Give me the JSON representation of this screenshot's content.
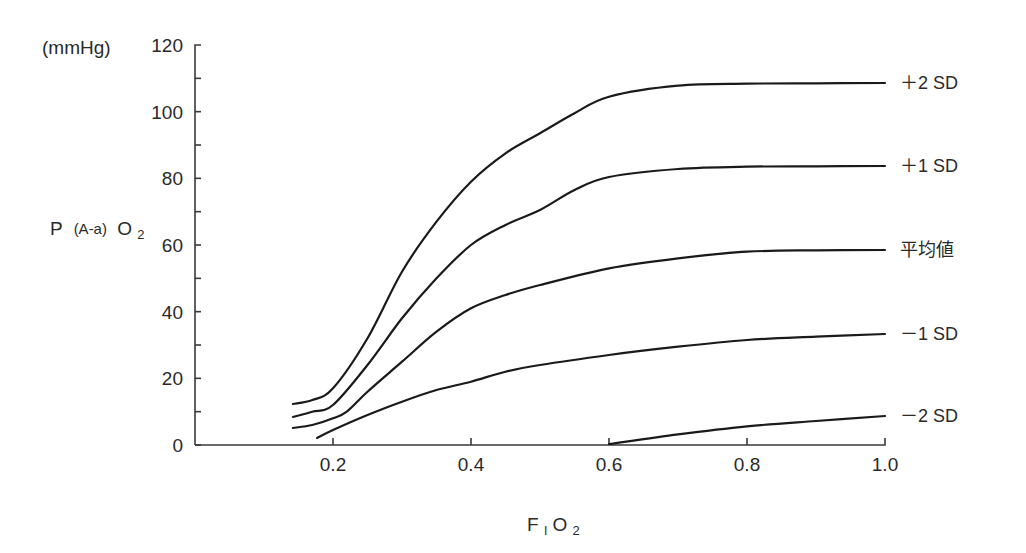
{
  "chart_data": {
    "type": "line",
    "title": "",
    "xlabel": "FIO2",
    "xlabel_main": "F",
    "xlabel_sub": "I",
    "xlabel_tail": "O",
    "xlabel_tail_sub": "2",
    "ylabel": "P(A-a)O2",
    "ylabel_parts": {
      "p": "P",
      "paren": "(A-a)",
      "o": "O",
      "sub": "2"
    },
    "yunit": "(mmHg)",
    "xlim": [
      0.0,
      1.0
    ],
    "ylim": [
      0,
      120
    ],
    "x_ticks": [
      0.2,
      0.4,
      0.6,
      0.8,
      1.0
    ],
    "x_tick_labels": [
      "0.2",
      "0.4",
      "0.6",
      "0.8",
      "1.0"
    ],
    "y_ticks": [
      0,
      20,
      40,
      60,
      80,
      100,
      120
    ],
    "y_tick_labels": [
      "0",
      "20",
      "40",
      "60",
      "80",
      "100",
      "120"
    ],
    "y_minor_ticks": [
      10,
      30,
      50,
      70,
      90,
      110
    ],
    "grid": false,
    "legend_position": "right (inline labels at curve ends)",
    "series": [
      {
        "name": "+2 SD",
        "label": "＋2 SD",
        "x": [
          0.142,
          0.17,
          0.2,
          0.25,
          0.3,
          0.35,
          0.4,
          0.45,
          0.5,
          0.55,
          0.6,
          0.7,
          0.8,
          0.9,
          1.0
        ],
        "values": [
          12.3,
          13.5,
          17,
          32,
          52,
          67,
          79,
          87.5,
          93.5,
          99.5,
          104.5,
          107.8,
          108.4,
          108.5,
          108.6
        ]
      },
      {
        "name": "+1 SD",
        "label": "＋1 SD",
        "x": [
          0.142,
          0.17,
          0.2,
          0.25,
          0.3,
          0.35,
          0.4,
          0.45,
          0.5,
          0.55,
          0.6,
          0.7,
          0.8,
          0.9,
          1.0
        ],
        "values": [
          8.4,
          10,
          12,
          24,
          38,
          50,
          60,
          66,
          70.5,
          76.5,
          80.4,
          82.8,
          83.5,
          83.6,
          83.7
        ]
      },
      {
        "name": "平均値",
        "label": "平均値",
        "x": [
          0.142,
          0.17,
          0.2,
          0.22,
          0.25,
          0.3,
          0.35,
          0.4,
          0.45,
          0.5,
          0.6,
          0.7,
          0.8,
          0.9,
          1.0
        ],
        "values": [
          5.1,
          6,
          8,
          10,
          16,
          25,
          34,
          41,
          45,
          48,
          53,
          56,
          58,
          58.4,
          58.5
        ]
      },
      {
        "name": "-1 SD",
        "label": "－1 SD",
        "x": [
          0.177,
          0.2,
          0.25,
          0.3,
          0.35,
          0.4,
          0.45,
          0.5,
          0.6,
          0.7,
          0.8,
          0.9,
          1.0
        ],
        "values": [
          2.1,
          4.5,
          9,
          13,
          16.5,
          19,
          22,
          24,
          27,
          29.5,
          31.5,
          32.5,
          33.3
        ]
      },
      {
        "name": "-2 SD",
        "label": "－2 SD",
        "x": [
          0.6,
          0.7,
          0.8,
          0.9,
          1.0
        ],
        "values": [
          0.3,
          3.2,
          5.6,
          7.2,
          8.7
        ]
      }
    ]
  }
}
